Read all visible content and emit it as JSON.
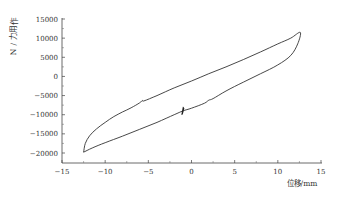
{
  "chart_data": {
    "type": "line",
    "title": "",
    "xlabel": "位移/mm",
    "ylabel": "作用力/N",
    "xlim": [
      -15,
      15
    ],
    "ylim": [
      -22500,
      15000
    ],
    "x_ticks": [
      -15,
      -10,
      -5,
      0,
      5,
      10,
      15
    ],
    "x_tick_labels": [
      "−15",
      "−10",
      "−5",
      "0",
      "5",
      "10",
      "15"
    ],
    "y_ticks": [
      15000,
      10000,
      5000,
      0,
      -5000,
      -10000,
      -15000,
      -20000
    ],
    "y_tick_labels": [
      "15000",
      "10000",
      "5000",
      "0",
      "−5000",
      "−10000",
      "−15000",
      "−20000"
    ],
    "grid": false,
    "legend": null,
    "series": [
      {
        "name": "hysteresis loop",
        "color": "#333333",
        "upper_branch": {
          "x": [
            -12.5,
            -12.3,
            -11.8,
            -11.0,
            -10.0,
            -9.0,
            -8.0,
            -7.0,
            -6.0,
            -5.7,
            -5.5,
            -4.0,
            -2.0,
            0.0,
            2.0,
            4.0,
            6.0,
            8.0,
            10.0,
            11.5,
            12.6
          ],
          "y": [
            -19800,
            -17500,
            -15500,
            -13700,
            -12000,
            -10500,
            -9300,
            -8200,
            -6900,
            -6300,
            -6400,
            -5000,
            -3000,
            -1200,
            700,
            2500,
            4400,
            6400,
            8500,
            10000,
            11500
          ]
        },
        "lower_branch": {
          "x": [
            12.6,
            12.3,
            11.5,
            10.0,
            8.0,
            6.0,
            4.0,
            2.5,
            2.0,
            1.5,
            0.0,
            -1.0,
            -2.0,
            -4.0,
            -6.0,
            -8.0,
            -10.0,
            -11.5,
            -12.5
          ],
          "y": [
            11500,
            8500,
            5500,
            3000,
            700,
            -1500,
            -3800,
            -5800,
            -6200,
            -7000,
            -8300,
            -9000,
            -10000,
            -12000,
            -13800,
            -15600,
            -17300,
            -18700,
            -19800
          ]
        },
        "annotations": [
          {
            "x": -1.0,
            "y": -9000,
            "note": "small spike / glitch on lower branch"
          }
        ]
      }
    ]
  }
}
